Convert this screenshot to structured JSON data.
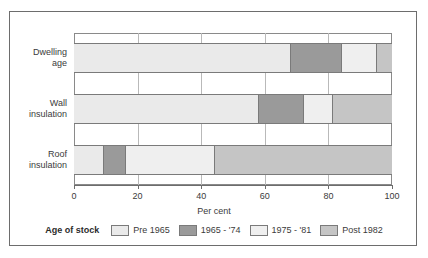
{
  "chart_data": {
    "type": "bar",
    "orientation": "horizontal",
    "stacked": true,
    "title": "",
    "xlabel": "Per cent",
    "ylabel": "",
    "xlim": [
      0,
      100
    ],
    "xticks": [
      0,
      20,
      40,
      60,
      80,
      100
    ],
    "xtick_labels": [
      "0",
      "20",
      "40",
      "60",
      "80",
      "100"
    ],
    "grid": true,
    "legend_position": "bottom",
    "legend_title": "Age of stock",
    "categories": [
      "Dwelling age",
      "Wall insulation",
      "Roof insulation"
    ],
    "category_lines": [
      [
        "Dwelling",
        "age"
      ],
      [
        "Wall",
        "insulation"
      ],
      [
        "Roof",
        "insulation"
      ]
    ],
    "series": [
      {
        "name": "Pre 1965",
        "color": "#eaeaea",
        "values": [
          68,
          58,
          9
        ]
      },
      {
        "name": "1965 - '74",
        "color": "#9a9a9a",
        "values": [
          16,
          14,
          7
        ]
      },
      {
        "name": "1975 - '81",
        "color": "#efefef",
        "values": [
          11,
          9,
          28
        ]
      },
      {
        "name": "Post 1982",
        "color": "#c5c5c5",
        "values": [
          5,
          19,
          56
        ]
      }
    ],
    "cumulative_boundaries": {
      "Dwelling age": [
        68,
        84,
        95,
        100
      ],
      "Wall insulation": [
        58,
        72,
        81,
        100
      ],
      "Roof insulation": [
        9,
        16,
        44,
        100
      ]
    }
  },
  "colors": {
    "frame": "#6d6d6d",
    "gridline": "#b9b9b9",
    "bar_outline": "#7a7a7a",
    "text": "#3b3b3b",
    "background": "#ffffff"
  }
}
